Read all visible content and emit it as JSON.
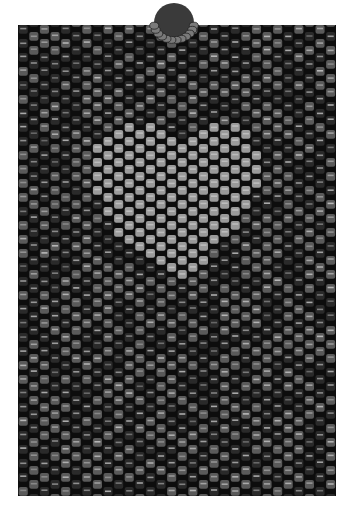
{
  "image": {
    "subject": "Peyote-stitch beaded panel with bead loop",
    "description": "Grayscale beadwork panel of cylinder beads in offset rows with a faint lighter heart motif and a circular beaded loop at top center",
    "background_color": "#ffffff",
    "panel": {
      "x": 18,
      "y": 25,
      "width": 318,
      "height": 471,
      "base_color": "#0d0d0d"
    },
    "beads": {
      "columns": 30,
      "col_width": 10.6,
      "row_step": 14,
      "half_offset": 7,
      "dark": "#2a2a2a",
      "mid": "#5a5a5a",
      "light": "#8c8c8c",
      "highlight": "#d8d8d8"
    },
    "heart": {
      "cx": 176,
      "cy": 215,
      "scale": 118,
      "color": "#9a9a9a"
    },
    "loop": {
      "cx": 174,
      "cy": 23,
      "r": 20,
      "color": "#7a7a7a"
    }
  }
}
